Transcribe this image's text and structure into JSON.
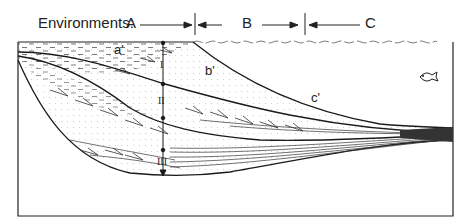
{
  "header": {
    "title": "Environments:",
    "environments": [
      {
        "label": "A"
      },
      {
        "label": "B"
      },
      {
        "label": "C"
      }
    ]
  },
  "diagram": {
    "facies_labels": [
      "a'",
      "b'",
      "c'"
    ],
    "units": [
      "I",
      "II",
      "III"
    ],
    "icons": [
      "fish-icon"
    ],
    "colors": {
      "line": "#1a1a1a",
      "background": "#ffffff",
      "stipple": "#9a9a9a"
    }
  }
}
